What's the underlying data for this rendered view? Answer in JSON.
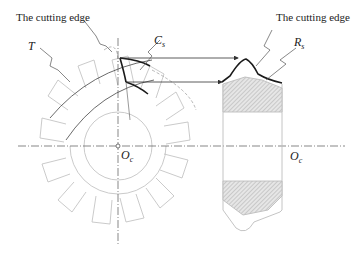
{
  "labels": {
    "cutting_edge_left": "The cutting edge",
    "cutting_edge_right": "The cutting edge",
    "T": "T",
    "Cs_main": "C",
    "Cs_sub": "s",
    "Rs_main": "R",
    "Rs_sub": "s",
    "Oc_left_main": "O",
    "Oc_left_sub": "c",
    "Oc_right_main": "O",
    "Oc_right_sub": "c"
  },
  "colors": {
    "outline": "#bdbdbd",
    "bold_edge": "#1a1a1a",
    "hatch": "#9a9a9a",
    "centerline": "#555555"
  }
}
